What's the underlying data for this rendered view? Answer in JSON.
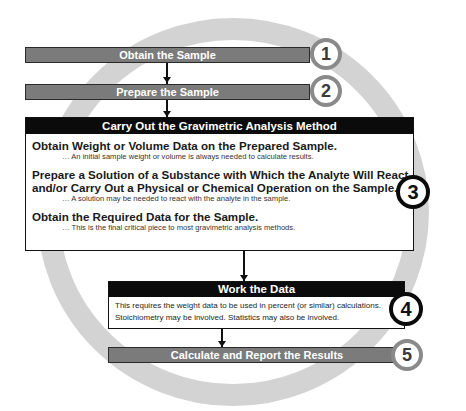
{
  "diagram": {
    "colors": {
      "ring": "#d3d3d3",
      "gray_bar": "#7b7b7b",
      "header_black": "#0b0b0b",
      "gray_circle_border": "#8a8a8a",
      "black_circle_border": "#0b0b0b"
    },
    "steps": [
      {
        "number": "1",
        "label": "Obtain the Sample",
        "style": "gray-bar"
      },
      {
        "number": "2",
        "label": "Prepare the Sample",
        "style": "gray-bar"
      },
      {
        "number": "3",
        "label": "Carry Out the Gravimetric Analysis Method",
        "style": "black-header-box",
        "items": [
          {
            "title_lines": [
              "Obtain Weight or Volume Data on the Prepared Sample."
            ],
            "note": "… An initial sample weight or volume is always needed to calculate results."
          },
          {
            "title_lines": [
              "Prepare a Solution of a Substance with Which the Analyte Will React",
              "and/or Carry Out a Physical or Chemical Operation on the Sample."
            ],
            "note": "… A solution may be needed to react with the analyte in the sample."
          },
          {
            "title_lines": [
              "Obtain the Required Data for the Sample."
            ],
            "note": "… This is the final critical piece to most gravimetric analysis methods."
          }
        ]
      },
      {
        "number": "4",
        "label": "Work the Data",
        "style": "black-header-box",
        "body_lines": [
          "This requires the weight data to be used in percent (or similar) calculations.",
          "Stoichiometry may be involved. Statistics may also be involved."
        ]
      },
      {
        "number": "5",
        "label": "Calculate and Report the Results",
        "style": "gray-bar"
      }
    ],
    "connectors": [
      {
        "from": "1",
        "to": "2",
        "type": "arrow-down"
      },
      {
        "from": "2",
        "to": "3",
        "type": "arrow-down"
      },
      {
        "from": "3",
        "to": "4",
        "type": "arrow-down"
      },
      {
        "from": "4",
        "to": "5",
        "type": "arrow-down"
      }
    ]
  }
}
